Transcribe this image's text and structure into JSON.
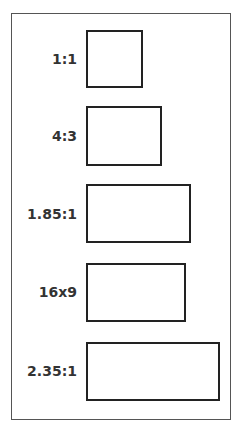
{
  "diagram": {
    "items": [
      {
        "label": "1:1",
        "top": 30,
        "width": 57,
        "height": 58
      },
      {
        "label": "4:3",
        "top": 106,
        "width": 76,
        "height": 60
      },
      {
        "label": "1.85:1",
        "top": 184,
        "width": 105,
        "height": 59
      },
      {
        "label": "16x9",
        "top": 263,
        "width": 100,
        "height": 59
      },
      {
        "label": "2.35:1",
        "top": 342,
        "width": 134,
        "height": 59
      }
    ]
  }
}
